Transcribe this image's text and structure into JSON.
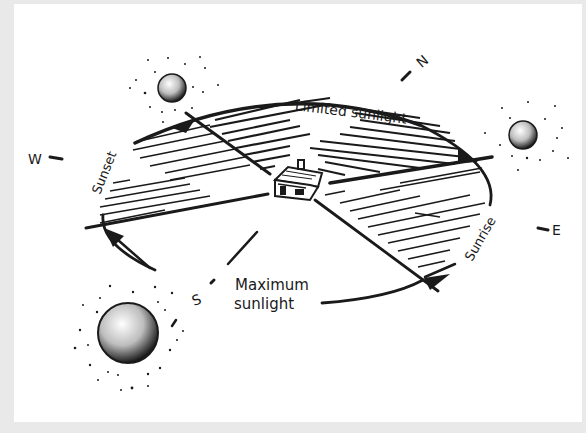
{
  "diagram": {
    "compass": {
      "north": "N",
      "south": "S",
      "east": "E",
      "west": "W"
    },
    "labels": {
      "limited": "Limited sunlight",
      "sunset": "Sunset",
      "sunrise": "Sunrise",
      "maximum_line1": "Maximum",
      "maximum_line2": "sunlight"
    },
    "icons": [
      "sun-icon-west",
      "sun-icon-east",
      "sun-icon-south",
      "house-icon"
    ],
    "colors": {
      "ink": "#1a1a1a",
      "background": "#ffffff",
      "frame": "#e9e9e9"
    }
  }
}
